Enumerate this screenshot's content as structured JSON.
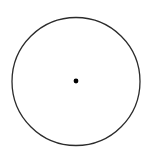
{
  "figure": {
    "name": "circle-with-center-point",
    "background_color": "#ffffff",
    "canvas": {
      "width": 152,
      "height": 148
    },
    "shapes": {
      "circle": {
        "label": "circle-outline",
        "center_x": 76,
        "center_y": 81.5,
        "radius": 64,
        "stroke_color": "#2b2b2b",
        "stroke_width": 1.3,
        "fill": "none"
      },
      "center_dot": {
        "label": "center-point",
        "center_x": 76,
        "center_y": 81,
        "radius": 2.4,
        "fill_color": "#000000"
      }
    },
    "labels": {
      "title": "",
      "center_label": "",
      "radius_label": ""
    }
  }
}
